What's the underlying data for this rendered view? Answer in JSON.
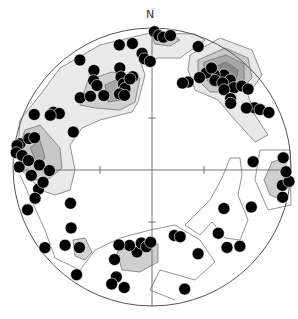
{
  "figure": {
    "type": "stereonet",
    "projection": "equal-area (Schmidt), lower hemisphere",
    "north_label": "N",
    "colors": {
      "outline": "#555555",
      "contour_line": "#666666",
      "fill_level_1": "#e4e4e4",
      "fill_level_2": "#c8c8c8",
      "fill_level_3": "#a8a8a8",
      "fill_level_4": "#8c8c8c",
      "pole": "#000000",
      "pole_edge": "#ffffff"
    }
  },
  "chart_data": {
    "type": "scatter",
    "subtype": "stereonet-poles-with-density-contours",
    "title": "",
    "axes_labels": {
      "north": "N"
    },
    "contour_levels": 4,
    "poles": [
      {
        "trend": 345,
        "plunge": 10
      },
      {
        "trend": 351,
        "plunge": 11
      },
      {
        "trend": 326,
        "plunge": 8
      },
      {
        "trend": 1,
        "plunge": 3
      },
      {
        "trend": 3,
        "plunge": 6
      },
      {
        "trend": 5,
        "plunge": 7
      },
      {
        "trend": 8,
        "plunge": 5
      },
      {
        "trend": 21,
        "plunge": 8
      },
      {
        "trend": 355,
        "plunge": 19
      },
      {
        "trend": 356,
        "plunge": 23
      },
      {
        "trend": 359,
        "plunge": 25
      },
      {
        "trend": 329,
        "plunge": 20
      },
      {
        "trend": 342,
        "plunge": 26
      },
      {
        "trend": 326,
        "plunge": 26
      },
      {
        "trend": 326,
        "plunge": 30
      },
      {
        "trend": 341,
        "plunge": 32
      },
      {
        "trend": 341,
        "plunge": 37
      },
      {
        "trend": 348,
        "plunge": 34
      },
      {
        "trend": 341,
        "plunge": 40
      },
      {
        "trend": 346,
        "plunge": 35
      },
      {
        "trend": 314,
        "plunge": 29
      },
      {
        "trend": 319,
        "plunge": 33
      },
      {
        "trend": 326,
        "plunge": 38
      },
      {
        "trend": 336,
        "plunge": 42
      },
      {
        "trend": 339,
        "plunge": 44
      },
      {
        "trend": 299,
        "plunge": 20
      },
      {
        "trend": 300,
        "plunge": 24
      },
      {
        "trend": 297,
        "plunge": 19
      },
      {
        "trend": 294,
        "plunge": 8
      },
      {
        "trend": 280,
        "plunge": 4
      },
      {
        "trend": 283,
        "plunge": 10
      },
      {
        "trend": 279,
        "plunge": 2
      },
      {
        "trend": 284,
        "plunge": 14
      },
      {
        "trend": 276,
        "plunge": 2
      },
      {
        "trend": 275,
        "plunge": 7
      },
      {
        "trend": 270,
        "plunge": 5
      },
      {
        "trend": 273,
        "plunge": 12
      },
      {
        "trend": 266,
        "plunge": 14
      },
      {
        "trend": 271,
        "plunge": 20
      },
      {
        "trend": 268,
        "plunge": 27
      },
      {
        "trend": 259,
        "plunge": 18
      },
      {
        "trend": 262,
        "plunge": 22
      },
      {
        "trend": 255,
        "plunge": 14
      },
      {
        "trend": 294,
        "plunge": 38
      },
      {
        "trend": 246,
        "plunge": 36
      },
      {
        "trend": 233,
        "plunge": 28
      },
      {
        "trend": 228,
        "plunge": 17
      },
      {
        "trend": 222,
        "plunge": 23
      },
      {
        "trend": 233,
        "plunge": 4
      },
      {
        "trend": 251,
        "plunge": 6
      },
      {
        "trend": 215,
        "plunge": 6
      },
      {
        "trend": 198,
        "plunge": 18
      },
      {
        "trend": 202,
        "plunge": 29
      },
      {
        "trend": 190,
        "plunge": 38
      },
      {
        "trend": 196,
        "plunge": 41
      },
      {
        "trend": 188,
        "plunge": 44
      },
      {
        "trend": 184,
        "plunge": 42
      },
      {
        "trend": 181,
        "plunge": 45
      },
      {
        "trend": 203,
        "plunge": 39
      },
      {
        "trend": 199,
        "plunge": 12
      },
      {
        "trend": 193,
        "plunge": 12
      },
      {
        "trend": 165,
        "plunge": 10
      },
      {
        "trend": 162,
        "plunge": 47
      },
      {
        "trend": 158,
        "plunge": 45
      },
      {
        "trend": 152,
        "plunge": 30
      },
      {
        "trend": 135,
        "plunge": 33
      },
      {
        "trend": 137,
        "plunge": 22
      },
      {
        "trend": 132,
        "plunge": 16
      },
      {
        "trend": 120,
        "plunge": 40
      },
      {
        "trend": 112,
        "plunge": 24
      },
      {
        "trend": 87,
        "plunge": 28
      },
      {
        "trend": 103,
        "plunge": 4
      },
      {
        "trend": 98,
        "plunge": 6
      },
      {
        "trend": 96,
        "plunge": 1
      },
      {
        "trend": 92,
        "plunge": 4
      },
      {
        "trend": 86,
        "plunge": 6
      },
      {
        "trend": 38,
        "plunge": 17
      },
      {
        "trend": 34,
        "plunge": 21
      },
      {
        "trend": 42,
        "plunge": 17
      },
      {
        "trend": 36,
        "plunge": 24
      },
      {
        "trend": 30,
        "plunge": 23
      },
      {
        "trend": 40,
        "plunge": 22
      },
      {
        "trend": 46,
        "plunge": 19
      },
      {
        "trend": 31,
        "plunge": 18
      },
      {
        "trend": 43,
        "plunge": 25
      },
      {
        "trend": 48,
        "plunge": 14
      },
      {
        "trend": 51,
        "plunge": 12
      },
      {
        "trend": 28,
        "plunge": 28
      },
      {
        "trend": 23,
        "plunge": 34
      },
      {
        "trend": 20,
        "plunge": 36
      },
      {
        "trend": 49,
        "plunge": 26
      },
      {
        "trend": 51,
        "plunge": 28
      },
      {
        "trend": 60,
        "plunge": 16
      },
      {
        "trend": 62,
        "plunge": 13
      },
      {
        "trend": 65,
        "plunge": 8
      },
      {
        "trend": 58,
        "plunge": 21
      }
    ]
  }
}
